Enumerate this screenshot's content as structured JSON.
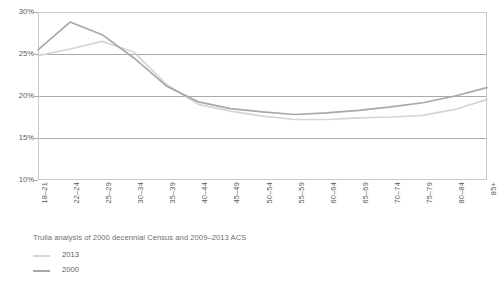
{
  "chart_data": {
    "type": "line",
    "title": "",
    "subtitle": "",
    "xlabel": "",
    "ylabel": "",
    "ylim": [
      10,
      30
    ],
    "ytick_values": [
      30,
      25,
      20,
      15,
      10
    ],
    "ytick_labels": [
      "30%",
      "25%",
      "20%",
      "15%",
      "10%"
    ],
    "grid": true,
    "legend_position": "below-left",
    "categories": [
      "18–21",
      "22–24",
      "25–29",
      "30–34",
      "35–39",
      "40–44",
      "45–49",
      "50–54",
      "55–59",
      "60–64",
      "65–69",
      "70–74",
      "75–79",
      "80–84",
      "85+"
    ],
    "series": [
      {
        "name": "2013",
        "color": "#d4d5d6",
        "values": [
          24.8,
          25.6,
          26.5,
          25.2,
          21.4,
          19.0,
          18.2,
          17.6,
          17.2,
          17.2,
          17.4,
          17.5,
          17.7,
          18.4,
          19.6
        ]
      },
      {
        "name": "2000",
        "color": "#a6a8ab",
        "values": [
          25.5,
          28.8,
          27.3,
          24.5,
          21.2,
          19.3,
          18.5,
          18.1,
          17.8,
          18.0,
          18.3,
          18.7,
          19.2,
          20.0,
          21.0
        ]
      }
    ],
    "caption": "Trulia analysis of 2000 decennial Census and 2009–2013 ACS",
    "legend": [
      {
        "label": "2013",
        "color": "#d4d5d6"
      },
      {
        "label": "2000",
        "color": "#a6a8ab"
      }
    ]
  }
}
